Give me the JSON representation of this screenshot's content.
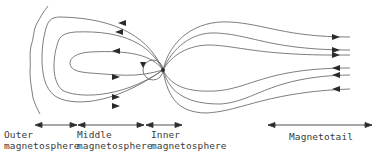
{
  "diagram": {
    "type": "magnetosphere-field-lines",
    "line_color": "#6e6e6e",
    "arrow_color": "#2a2a2a",
    "regions": [
      {
        "id": "outer",
        "line1": "Outer",
        "line2": "magnetosphere",
        "x_start": 35,
        "x_end": 77
      },
      {
        "id": "middle",
        "line1": "Middle",
        "line2": "magnetosphere",
        "x_start": 78,
        "x_end": 144
      },
      {
        "id": "inner",
        "line1": "Inner",
        "line2": "magnetosphere",
        "x_start": 146,
        "x_end": 182
      },
      {
        "id": "magnetotail",
        "line1": "Magnetotail",
        "line2": "",
        "x_start": 268,
        "x_end": 372
      }
    ]
  }
}
